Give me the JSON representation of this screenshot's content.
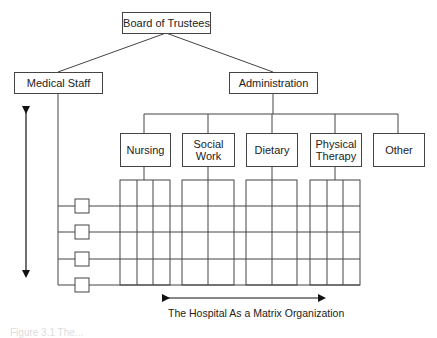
{
  "diagram": {
    "title": "The Hospital As a Matrix Organization",
    "nodes": {
      "board": "Board of Trustees",
      "medical_staff": "Medical Staff",
      "administration": "Administration",
      "departments": [
        {
          "label": "Nursing",
          "columns": 3
        },
        {
          "label": "Social Work",
          "columns": 2
        },
        {
          "label": "Dietary",
          "columns": 2
        },
        {
          "label": "Physical Therapy",
          "columns": 3
        },
        {
          "label": "Other",
          "columns": 0
        }
      ]
    },
    "medical_rows": 4,
    "figure_caption": "Figure 3.1 The..."
  },
  "colors": {
    "line": "#444444",
    "text": "#222222",
    "background": "#ffffff"
  }
}
